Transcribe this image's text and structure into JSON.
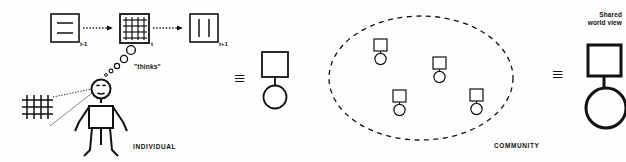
{
  "diagram": {
    "background_color": "#fefefe",
    "ink_color": "#111111"
  },
  "individual_panel": {
    "section_label": "INDIVIDUAL",
    "thought_label": "\"thinks\"",
    "state_boxes": [
      {
        "id": "state-prev",
        "time_label": "t-1",
        "content": "two-horizontal-lines"
      },
      {
        "id": "state-now",
        "time_label": "t",
        "content": "grid"
      },
      {
        "id": "state-next",
        "time_label": "t+1",
        "content": "two-vertical-lines"
      }
    ],
    "arrows": [
      {
        "id": "arrow-prev-to-now",
        "style": "dotted"
      },
      {
        "id": "arrow-now-to-next",
        "style": "dotted"
      }
    ],
    "thought_bubbles": 5,
    "observed_world": {
      "id": "world-grid",
      "content": "grid"
    },
    "sight_lines": 2,
    "figure": {
      "id": "stick-figure",
      "type": "person"
    }
  },
  "equivalence_1": {
    "symbol": "≡",
    "abstracted_individual": {
      "head_shape": "square",
      "body_shape": "circle"
    }
  },
  "community_panel": {
    "section_label": "COMMUNITY",
    "boundary": "dashed-ellipse",
    "members": [
      {
        "id": "member-1"
      },
      {
        "id": "member-2"
      },
      {
        "id": "member-3"
      },
      {
        "id": "member-4"
      }
    ]
  },
  "equivalence_2": {
    "symbol": "≡",
    "shared_world_view": {
      "label_line_1": "Shared",
      "label_line_2": "world view",
      "head_shape": "square",
      "body_shape": "circle"
    }
  }
}
